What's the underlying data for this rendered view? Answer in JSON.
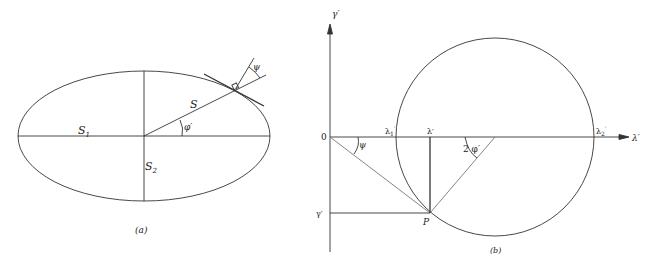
{
  "figure_a": {
    "caption": "(a)",
    "labels": {
      "major_semi_axis": "S",
      "major_semi_axis_sub": "1",
      "minor_semi_axis": "S",
      "minor_semi_axis_sub": "2",
      "radius": "S",
      "angle_phi": "φ′",
      "angle_psi": "ψ"
    }
  },
  "figure_b": {
    "caption": "(b)",
    "labels": {
      "y_axis": "γ′",
      "x_axis": "λ′",
      "origin": "0",
      "lambda1": "λ",
      "lambda1_sub": "1",
      "lambda1_sup": "′",
      "lambda2": "λ",
      "lambda2_sub": "2",
      "lambda2_sup": "′",
      "lambda_prime": "λ′",
      "gamma_prime": "γ′",
      "point_p": "P",
      "angle_psi": "ψ",
      "angle_2phi": "2 φ′"
    }
  }
}
